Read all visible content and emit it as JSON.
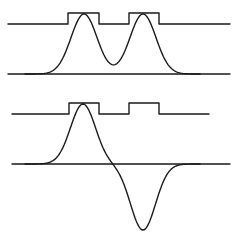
{
  "figure": {
    "stroke_color": "#1a1a1a",
    "background": "#ffffff",
    "panels": [
      {
        "id": "top",
        "pulse_train": {
          "baseline_y": 24,
          "high_y": 13,
          "x_start": 8,
          "x_end": 230,
          "pulses": [
            {
              "x0": 68,
              "x1": 99
            },
            {
              "x0": 129,
              "x1": 159
            }
          ]
        },
        "axis": {
          "y": 74,
          "x0": 8,
          "x1": 230
        },
        "curve": {
          "type": "double-peak (sum of two gaussians)",
          "peaks": [
            {
              "x": 84,
              "y": 14
            },
            {
              "x": 143,
              "y": 14
            }
          ],
          "valley": {
            "x": 114,
            "y": 64
          }
        }
      },
      {
        "id": "bottom",
        "pulse_train": {
          "baseline_y": 114,
          "high_y": 103,
          "x_start": 12,
          "x_end": 209,
          "pulses": [
            {
              "x0": 69,
              "x1": 99
            },
            {
              "x0": 129,
              "x1": 159
            }
          ]
        },
        "axis": {
          "y": 164,
          "x0": 12,
          "x1": 230
        },
        "curve": {
          "type": "bipolar (positive peak then negative trough)",
          "positive_peak": {
            "x": 83,
            "y": 104
          },
          "zero_crossing_x": 114,
          "negative_trough": {
            "x": 143,
            "y": 230
          }
        }
      }
    ]
  }
}
